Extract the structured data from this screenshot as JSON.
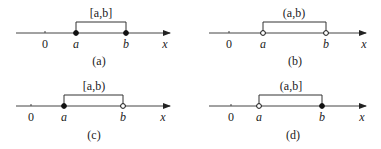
{
  "panels": [
    {
      "id": "a",
      "caption": "(a)",
      "interval_label": "[a,b]",
      "origin_label": "0",
      "a_label": "a",
      "b_label": "b",
      "axis_label": "x",
      "a_closed": true,
      "b_closed": true
    },
    {
      "id": "b",
      "caption": "(b)",
      "interval_label": "(a,b)",
      "origin_label": "0",
      "a_label": "a",
      "b_label": "b",
      "axis_label": "x",
      "a_closed": false,
      "b_closed": false
    },
    {
      "id": "c",
      "caption": "(c)",
      "interval_label": "[a,b)",
      "origin_label": "0",
      "a_label": "a",
      "b_label": "b",
      "axis_label": "x",
      "a_closed": true,
      "b_closed": false
    },
    {
      "id": "d",
      "caption": "(d)",
      "interval_label": "(a,b]",
      "origin_label": "0",
      "a_label": "a",
      "b_label": "b",
      "axis_label": "x",
      "a_closed": false,
      "b_closed": true
    }
  ],
  "colors": {
    "line": "#333333",
    "text": "#222222",
    "open_fill": "#ffffff"
  }
}
